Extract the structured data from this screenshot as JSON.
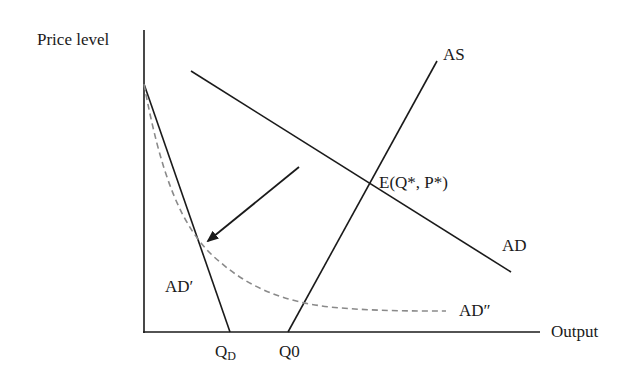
{
  "diagram": {
    "type": "economics AD-AS diagram",
    "axes": {
      "y_label": "Price level",
      "x_label": "Output"
    },
    "curves": [
      {
        "id": "AS",
        "label": "AS",
        "style": "solid"
      },
      {
        "id": "AD",
        "label": "AD",
        "style": "solid"
      },
      {
        "id": "AD_prime",
        "label": "AD′",
        "style": "solid"
      },
      {
        "id": "AD_double_prime",
        "label": "AD″",
        "style": "dashed"
      }
    ],
    "equilibrium_label": "E(Q*, P*)",
    "x_ticks": {
      "qd_main": "Q",
      "qd_sub": "D",
      "q0": "Q0"
    },
    "arrow": {
      "direction": "down-left",
      "meaning": "shift from AD toward AD″"
    },
    "colors": {
      "line": "#1a1a1a",
      "dashed": "#8a8a8a",
      "background": "#ffffff"
    }
  }
}
